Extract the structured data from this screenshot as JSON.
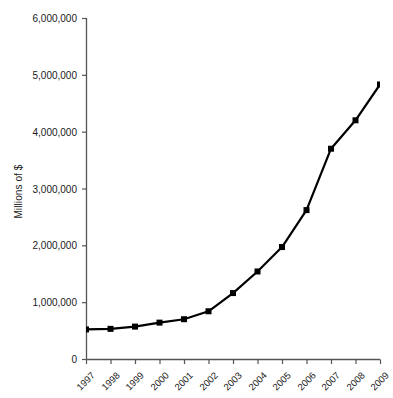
{
  "chart_data": {
    "type": "line",
    "title": "",
    "subtitle": "",
    "xlabel": "",
    "ylabel": "Millions of $",
    "categories": [
      "1997",
      "1998",
      "1999",
      "2000",
      "2001",
      "2002",
      "2003",
      "2004",
      "2005",
      "2006",
      "2007",
      "2008",
      "2009"
    ],
    "values": [
      520000,
      530000,
      570000,
      640000,
      700000,
      840000,
      1160000,
      1540000,
      1970000,
      2620000,
      3700000,
      4200000,
      4830000
    ],
    "series": [
      {
        "name": "Millions of $",
        "values": [
          520000,
          530000,
          570000,
          640000,
          700000,
          840000,
          1160000,
          1540000,
          1970000,
          2620000,
          3700000,
          4200000,
          4830000
        ]
      }
    ],
    "ylim": [
      0,
      6000000
    ],
    "y_ticks": [
      0,
      1000000,
      2000000,
      3000000,
      4000000,
      5000000,
      6000000
    ],
    "y_tick_labels": [
      "0",
      "1,000,000",
      "2,000,000",
      "3,000,000",
      "4,000,000",
      "5,000,000",
      "6,000,000"
    ],
    "x_tick_labels": [
      "1997",
      "1998",
      "1999",
      "2000",
      "2001",
      "2002",
      "2003",
      "2004",
      "2005",
      "2006",
      "2007",
      "2008",
      "2009"
    ],
    "grid": false,
    "legend": false,
    "legend_position": "none",
    "marker": "square",
    "line_color": "#000000",
    "marker_color": "#000000",
    "axis_color": "#555555",
    "background_color": "#ffffff",
    "x_label_rotation": -45
  }
}
